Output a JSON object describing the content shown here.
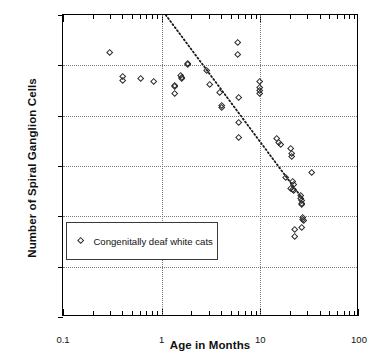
{
  "chart_data": {
    "type": "scatter",
    "title": "",
    "xlabel": "Age in Months",
    "ylabel": "Number of Spiral Ganglion Cells",
    "xscale": "log",
    "yscale": "linear",
    "xlim": [
      0.1,
      100
    ],
    "ylim": [
      0,
      60000
    ],
    "grid": true,
    "legend_position": "inside-lower-left",
    "x_tick_labels": [
      "0.1",
      "1",
      "10",
      "100"
    ],
    "x_tick_values": [
      0.1,
      1,
      10,
      100
    ],
    "y_tick_labels": [
      "0",
      "10,000",
      "20,000",
      "30,000",
      "40,000",
      "50,000",
      "60,000"
    ],
    "y_tick_values": [
      0,
      10000,
      20000,
      30000,
      40000,
      50000,
      60000
    ],
    "series": [
      {
        "name": "Congenitally deaf white cats",
        "marker": "open-diamond",
        "color": "#2b2b2b",
        "points": [
          {
            "x": 0.3,
            "y": 52500
          },
          {
            "x": 0.4,
            "y": 47700
          },
          {
            "x": 0.4,
            "y": 47000
          },
          {
            "x": 0.62,
            "y": 47300
          },
          {
            "x": 0.83,
            "y": 46800
          },
          {
            "x": 1.35,
            "y": 46000
          },
          {
            "x": 1.35,
            "y": 45700
          },
          {
            "x": 1.35,
            "y": 44400
          },
          {
            "x": 1.55,
            "y": 48000
          },
          {
            "x": 1.6,
            "y": 47600
          },
          {
            "x": 1.6,
            "y": 47400
          },
          {
            "x": 1.82,
            "y": 50300
          },
          {
            "x": 1.85,
            "y": 50100
          },
          {
            "x": 2.85,
            "y": 48900
          },
          {
            "x": 3.05,
            "y": 46200
          },
          {
            "x": 3.9,
            "y": 44500
          },
          {
            "x": 4.05,
            "y": 42000
          },
          {
            "x": 4.1,
            "y": 41600
          },
          {
            "x": 5.9,
            "y": 54400
          },
          {
            "x": 5.95,
            "y": 52100
          },
          {
            "x": 6.0,
            "y": 43500
          },
          {
            "x": 6.05,
            "y": 38600
          },
          {
            "x": 6.1,
            "y": 35700
          },
          {
            "x": 9.8,
            "y": 46800
          },
          {
            "x": 9.85,
            "y": 45600
          },
          {
            "x": 9.9,
            "y": 44900
          },
          {
            "x": 9.95,
            "y": 44300
          },
          {
            "x": 14.5,
            "y": 35400
          },
          {
            "x": 15.5,
            "y": 34600
          },
          {
            "x": 16.0,
            "y": 34200
          },
          {
            "x": 20.5,
            "y": 33400
          },
          {
            "x": 21.0,
            "y": 32500
          },
          {
            "x": 21.0,
            "y": 31900
          },
          {
            "x": 18.0,
            "y": 27700
          },
          {
            "x": 21.5,
            "y": 26800
          },
          {
            "x": 22.0,
            "y": 26300
          },
          {
            "x": 20.5,
            "y": 25500
          },
          {
            "x": 21.5,
            "y": 25200
          },
          {
            "x": 22.0,
            "y": 25100
          },
          {
            "x": 25.5,
            "y": 24200
          },
          {
            "x": 25.5,
            "y": 23500
          },
          {
            "x": 26.0,
            "y": 23100
          },
          {
            "x": 26.0,
            "y": 22600
          },
          {
            "x": 26.5,
            "y": 22300
          },
          {
            "x": 33.0,
            "y": 28600
          },
          {
            "x": 27.0,
            "y": 19800
          },
          {
            "x": 27.0,
            "y": 19400
          },
          {
            "x": 27.5,
            "y": 19100
          },
          {
            "x": 22.5,
            "y": 17400
          },
          {
            "x": 26.5,
            "y": 17700
          },
          {
            "x": 22.5,
            "y": 15900
          }
        ]
      }
    ],
    "trendline": {
      "style": "dotted",
      "color": "#1a1a1a",
      "start": {
        "x": 1.1,
        "y": 60000
      },
      "end": {
        "x": 27.0,
        "y": 23400
      }
    }
  },
  "axes": {
    "y_title": "Number of Spiral Ganglion Cells",
    "x_title": "Age in Months"
  },
  "legend": {
    "label": "Congenitally deaf white cats"
  }
}
